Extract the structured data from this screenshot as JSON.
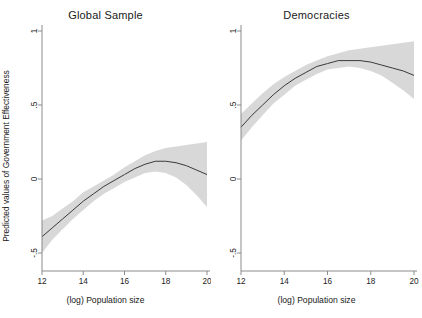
{
  "figure": {
    "background": "#ffffff",
    "band_color": "#d8d8d8",
    "line_color": "#3a3a3a",
    "axis_color": "#808080"
  },
  "axes": {
    "ylabel": "Predicted values of Government Effectiveness",
    "xlabel": "(log) Population size",
    "yticks": [
      "1",
      ".5",
      "0",
      "-.5"
    ],
    "yvalues": [
      1,
      0.5,
      0,
      -0.5
    ],
    "xticks": [
      "12",
      "14",
      "16",
      "18",
      "20"
    ],
    "xvalues": [
      12,
      14,
      16,
      18,
      20
    ]
  },
  "panels": [
    {
      "title": "Global Sample"
    },
    {
      "title": "Democracies"
    }
  ],
  "chart_data": {
    "type": "line",
    "title": "",
    "xlabel": "(log) Population size",
    "ylabel": "Predicted values of Government Effectiveness",
    "xlim": [
      12,
      20
    ],
    "ylim": [
      -0.62,
      1.1
    ],
    "grid": false,
    "legend": "none",
    "panels": [
      {
        "name": "Global Sample",
        "x": [
          12,
          12.5,
          13,
          13.5,
          14,
          14.5,
          15,
          15.5,
          16,
          16.5,
          17,
          17.5,
          18,
          18.5,
          19,
          19.5,
          20
        ],
        "fit": [
          -0.39,
          -0.33,
          -0.27,
          -0.21,
          -0.15,
          -0.1,
          -0.05,
          -0.01,
          0.03,
          0.07,
          0.1,
          0.12,
          0.12,
          0.11,
          0.09,
          0.06,
          0.03
        ],
        "ci_lower": [
          -0.5,
          -0.41,
          -0.34,
          -0.27,
          -0.21,
          -0.15,
          -0.1,
          -0.06,
          -0.02,
          0.01,
          0.04,
          0.05,
          0.04,
          0.01,
          -0.04,
          -0.11,
          -0.19
        ],
        "ci_upper": [
          -0.28,
          -0.25,
          -0.2,
          -0.15,
          -0.09,
          -0.05,
          -0.01,
          0.03,
          0.08,
          0.12,
          0.16,
          0.19,
          0.21,
          0.22,
          0.23,
          0.24,
          0.25
        ]
      },
      {
        "name": "Democracies",
        "x": [
          12,
          12.5,
          13,
          13.5,
          14,
          14.5,
          15,
          15.5,
          16,
          16.5,
          17,
          17.5,
          18,
          18.5,
          19,
          19.5,
          20
        ],
        "fit": [
          0.35,
          0.43,
          0.5,
          0.57,
          0.63,
          0.68,
          0.72,
          0.76,
          0.78,
          0.8,
          0.8,
          0.8,
          0.79,
          0.77,
          0.75,
          0.73,
          0.7
        ],
        "ci_lower": [
          0.26,
          0.35,
          0.43,
          0.51,
          0.57,
          0.63,
          0.67,
          0.71,
          0.74,
          0.75,
          0.76,
          0.75,
          0.73,
          0.7,
          0.65,
          0.6,
          0.54
        ],
        "ci_upper": [
          0.44,
          0.51,
          0.58,
          0.64,
          0.69,
          0.73,
          0.77,
          0.8,
          0.83,
          0.85,
          0.87,
          0.88,
          0.89,
          0.9,
          0.91,
          0.92,
          0.93
        ]
      }
    ]
  }
}
